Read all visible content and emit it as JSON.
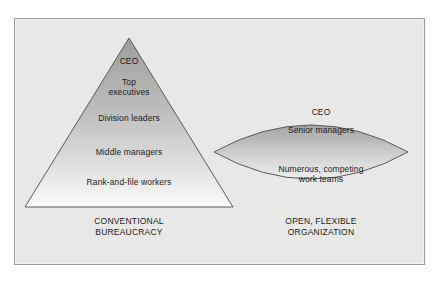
{
  "figure": {
    "name": "organization-structures-comparison",
    "panel": {
      "background_color": "#e8e8e6",
      "border_color": "#9a9a98"
    }
  },
  "triangle": {
    "shape": "triangle",
    "caption": "CONVENTIONAL\nBUREAUCRACY",
    "gradient": {
      "top_color": "#9d9d9b",
      "bottom_color": "#fbfbfa"
    },
    "outline_color": "#5a5a58",
    "levels": [
      {
        "label": "CEO"
      },
      {
        "label": "Top\nexecutives"
      },
      {
        "label": "Division leaders"
      },
      {
        "label": "Middle managers"
      },
      {
        "label": "Rank-and-file workers"
      }
    ]
  },
  "lens": {
    "shape": "lens",
    "caption": "OPEN, FLEXIBLE\nORGANIZATION",
    "gradient": {
      "top_color": "#a4a4a2",
      "bottom_color": "#eeeeec"
    },
    "outline_color": "#5a5a58",
    "levels": [
      {
        "label": "CEO"
      },
      {
        "label": "Senior managers"
      },
      {
        "label": "Numerous, competing\nwork teams"
      }
    ]
  }
}
